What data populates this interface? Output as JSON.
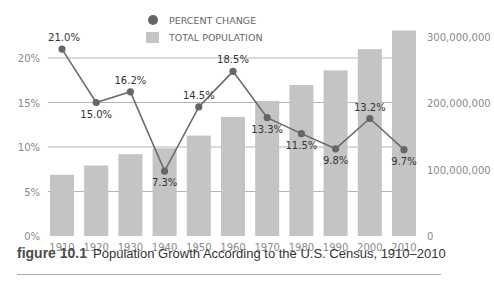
{
  "legend": {
    "line_label": "PERCENT CHANGE",
    "bar_label": "TOTAL POPULATION"
  },
  "caption": {
    "number": "figure 10.1",
    "text": "Population Growth According to the U.S. Census, 1910–2010"
  },
  "colors": {
    "bar": "#c4c4c4",
    "line": "#6b6b6b",
    "marker": "#666666",
    "grid": "#b5b5b5"
  },
  "chart_data": {
    "type": "bar",
    "title": "Population Growth According to the U.S. Census, 1910–2010",
    "xlabel": "",
    "categories": [
      "1910",
      "1920",
      "1930",
      "1940",
      "1950",
      "1960",
      "1970",
      "1980",
      "1990",
      "2000",
      "2010"
    ],
    "series": [
      {
        "name": "TOTAL POPULATION",
        "type": "bar",
        "axis": "right",
        "values": [
          92000000,
          106000000,
          123000000,
          132000000,
          151000000,
          179000000,
          203000000,
          227000000,
          249000000,
          281000000,
          309000000
        ]
      },
      {
        "name": "PERCENT CHANGE",
        "type": "line",
        "axis": "left",
        "values": [
          21.0,
          15.0,
          16.2,
          7.3,
          14.5,
          18.5,
          13.3,
          11.5,
          9.8,
          13.2,
          9.7
        ],
        "labels": [
          "21.0%",
          "15.0%",
          "16.2%",
          "7.3%",
          "14.5%",
          "18.5%",
          "13.3%",
          "11.5%",
          "9.8%",
          "13.2%",
          "9.7%"
        ]
      }
    ],
    "left_axis": {
      "ticks": [
        "0%",
        "5%",
        "10%",
        "15%",
        "20%"
      ],
      "ylim": [
        0,
        22
      ]
    },
    "right_axis": {
      "ticks": [
        "0",
        "100,000,000",
        "200,000,000",
        "300,000,000"
      ],
      "ylim": [
        0,
        300000000
      ]
    },
    "grid": true,
    "legend_position": "top-center"
  }
}
